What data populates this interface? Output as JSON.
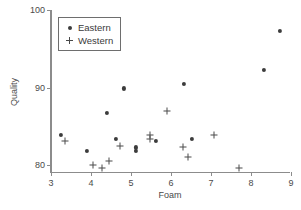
{
  "chart_data": {
    "type": "scatter",
    "title": "",
    "xlabel": "Foam",
    "ylabel": "Quality",
    "xlim": [
      3,
      9
    ],
    "ylim": [
      79,
      100
    ],
    "xticks": [
      3,
      4,
      5,
      6,
      7,
      8,
      9
    ],
    "yticks": [
      80,
      90,
      100
    ],
    "grid": false,
    "legend_position": "upper-left",
    "series": [
      {
        "name": "Eastern",
        "marker": "dot",
        "color": "#3c3c3c",
        "points": [
          [
            3.25,
            83.9
          ],
          [
            3.9,
            81.8
          ],
          [
            4.4,
            86.7
          ],
          [
            4.62,
            83.4
          ],
          [
            4.82,
            89.9
          ],
          [
            5.12,
            82.3
          ],
          [
            5.12,
            81.8
          ],
          [
            5.62,
            83.1
          ],
          [
            6.32,
            90.5
          ],
          [
            6.52,
            83.4
          ],
          [
            8.32,
            92.3
          ],
          [
            8.72,
            97.3
          ]
        ]
      },
      {
        "name": "Western",
        "marker": "plus",
        "color": "#4a4a4a",
        "points": [
          [
            3.35,
            83.1
          ],
          [
            4.05,
            80.0
          ],
          [
            4.28,
            79.6
          ],
          [
            4.45,
            80.6
          ],
          [
            4.72,
            82.5
          ],
          [
            5.48,
            83.9
          ],
          [
            5.48,
            83.4
          ],
          [
            5.9,
            87.0
          ],
          [
            6.3,
            82.3
          ],
          [
            6.42,
            81.1
          ],
          [
            7.08,
            83.9
          ],
          [
            7.7,
            79.7
          ]
        ]
      }
    ]
  }
}
